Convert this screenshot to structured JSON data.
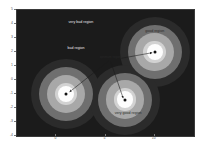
{
  "chart_data": {
    "type": "heatmap",
    "title": "",
    "xlabel": "",
    "ylabel": "",
    "xlim": [
      -4,
      14
    ],
    "ylim": [
      -4,
      5
    ],
    "grid": false,
    "legend": "none",
    "colormap": "grayscale",
    "xticks": [
      0,
      5,
      10
    ],
    "xticklabels": [
      "0",
      "5",
      "10"
    ],
    "yticks": [
      -4,
      -3,
      -2,
      -1,
      0,
      1,
      2,
      3,
      4,
      5
    ],
    "yticklabels": [
      "-4",
      "-3",
      "-2",
      "-1",
      "0",
      "1",
      "2",
      "3",
      "4",
      "5"
    ],
    "basins": [
      {
        "name": "left-basin",
        "center_x": 1.0,
        "center_y": -1.0,
        "quality": "good",
        "radii": [
          1.15,
          1.95,
          2.75,
          3.55
        ]
      },
      {
        "name": "right-basin",
        "center_x": 10.0,
        "center_y": 2.0,
        "quality": "good",
        "radii": [
          1.15,
          1.95,
          2.75,
          3.55
        ]
      },
      {
        "name": "center-basin",
        "center_x": 7.0,
        "center_y": -1.4,
        "quality": "very good",
        "radii": [
          1.15,
          1.95,
          2.75,
          3.55
        ]
      }
    ],
    "markers": [
      {
        "name": "optimum-left",
        "x": 1.0,
        "y": -1.0
      },
      {
        "name": "optimum-right",
        "x": 10.0,
        "y": 2.0
      },
      {
        "name": "optimum-center",
        "x": 7.0,
        "y": -1.4
      }
    ],
    "annotations": [
      {
        "name": "very-bad-region",
        "text": "very bad region",
        "x": 2.5,
        "y": 4.05,
        "tone": "light",
        "arrow": false
      },
      {
        "name": "bad-region",
        "text": "bad region",
        "x": 2.0,
        "y": 2.25,
        "tone": "light",
        "arrow": false
      },
      {
        "name": "good-region",
        "text": "good region",
        "x": 10.0,
        "y": 3.4,
        "tone": "dark",
        "arrow": false
      },
      {
        "name": "very-good-region",
        "text": "very good region",
        "x": 7.3,
        "y": -2.45,
        "tone": "dark",
        "arrow": false
      },
      {
        "name": "optimum-callout",
        "text": "optimum region",
        "x": 5.5,
        "y": 1.6,
        "tone": "dark",
        "arrow": true
      }
    ],
    "arrows": [
      {
        "name": "arrow-to-right-optimum",
        "x1": 6.6,
        "y1": 1.55,
        "x2": 9.75,
        "y2": 1.95
      },
      {
        "name": "arrow-to-left-optimum",
        "x1": 5.3,
        "y1": 1.35,
        "x2": 1.35,
        "y2": -0.85
      },
      {
        "name": "arrow-to-center-optimum",
        "x1": 5.5,
        "y1": 1.35,
        "x2": 6.8,
        "y2": -1.3
      }
    ]
  },
  "figure": {
    "background": "#ffffff",
    "plot_background": "#1b1b1b",
    "band_colors": [
      "#fdfdfd",
      "#d2d2d2",
      "#a8a8a8",
      "#6f6f6f",
      "#2b2b2b"
    ],
    "marker_color": "#111111",
    "arrow_color": "#1a1a1a"
  }
}
